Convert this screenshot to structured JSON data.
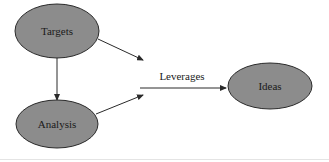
{
  "diagram": {
    "title": "",
    "colors": {
      "node_fill": "#8c8c8c",
      "node_stroke": "#2a2a2a",
      "edge": "#2a2a2a",
      "text": "#1a1a1a",
      "background": "#ffffff"
    },
    "nodes": [
      {
        "id": "targets",
        "label": "Targets",
        "shape": "ellipse",
        "cx": 57,
        "cy": 31,
        "rx": 42,
        "ry": 27
      },
      {
        "id": "analysis",
        "label": "Analysis",
        "shape": "ellipse",
        "cx": 57,
        "cy": 124,
        "rx": 41,
        "ry": 24
      },
      {
        "id": "ideas",
        "label": "Ideas",
        "shape": "ellipse",
        "cx": 270,
        "cy": 86,
        "rx": 42,
        "ry": 23
      }
    ],
    "edges": [
      {
        "id": "targets-to-analysis",
        "from": "targets",
        "to": "analysis",
        "label": ""
      },
      {
        "id": "targets-to-merge",
        "from": "targets",
        "to": "leverages-arrow",
        "label": ""
      },
      {
        "id": "analysis-to-merge",
        "from": "analysis",
        "to": "leverages-arrow",
        "label": ""
      },
      {
        "id": "leverages",
        "from": "merge",
        "to": "ideas",
        "label": "Leverages"
      }
    ]
  }
}
